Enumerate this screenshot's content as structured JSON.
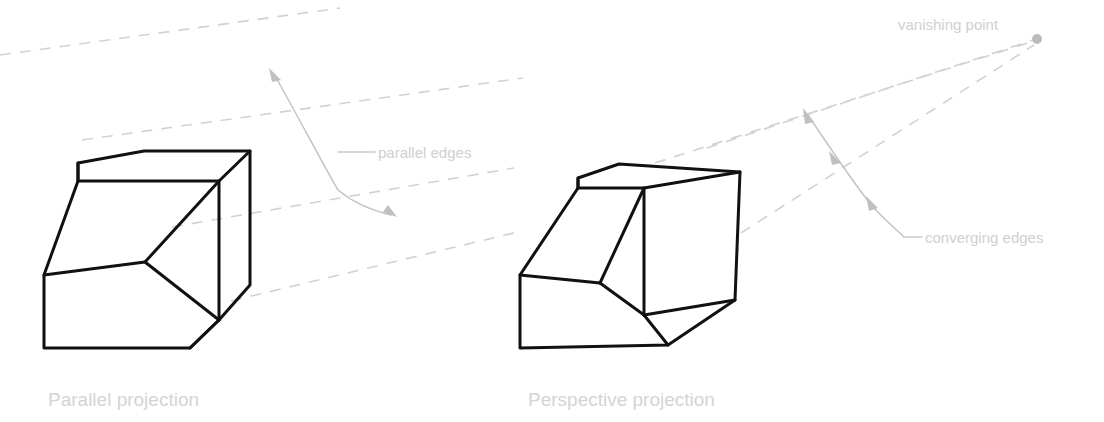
{
  "page": {
    "background_color": "#ffffff",
    "width": 1104,
    "height": 422
  },
  "colors": {
    "solid_edge": "#111111",
    "dashed_guide": "#d2d2d2",
    "annotation_line": "#c4c4c4",
    "annotation_text": "#d0d0d0",
    "caption_text": "#d4d4d4",
    "vanishing_point_dot": "#bcbcbc"
  },
  "panels": [
    {
      "id": "parallel",
      "caption": "Parallel projection",
      "annotations": [
        {
          "id": "parallel-edges",
          "text": "parallel edges"
        }
      ]
    },
    {
      "id": "perspective",
      "caption": "Perspective projection",
      "annotations": [
        {
          "id": "vanishing-point",
          "text": "vanishing point"
        },
        {
          "id": "converging-edges",
          "text": "converging edges"
        }
      ]
    }
  ],
  "labels": {
    "parallel_edges": "parallel edges",
    "vanishing_point": "vanishing point",
    "converging_edges": "converging edges",
    "caption_left": "Parallel projection",
    "caption_right": "Perspective projection"
  },
  "geometry": {
    "left_solid": {
      "description": "Box with a chamfered / beveled front-left-bottom corner drawn in parallel (axonometric) projection; all receding edges are mutually parallel.",
      "top_face": "M 78,163 L 144,151 L 250,151 L 219,181 L 78,181 Z",
      "right_face": "M 250,151 L 250,285 L 219,320 L 219,181 Z",
      "front_face": "M 44,275 L 145,262 L 219,320 L 190,348 L 44,348 Z",
      "bevel_face": "M 78,181 L 219,181 L 145,262 L 44,275 Z",
      "inner_vertical": "M 219,181 L 219,320",
      "y_junction": [
        145,
        262
      ]
    },
    "right_solid": {
      "description": "Same box drawn in one-point perspective; receding edges converge toward the vanishing point at the upper right.",
      "top_face": "M 578,178 L 619,164 L 740,172 L 644,188 L 578,188 Z",
      "right_face": "M 740,172 L 735,300 L 644,315 L 644,188 Z",
      "front_face": "M 520,275 L 600,283 L 644,315 L 668,345 L 520,348 Z",
      "bevel_face": "M 578,188 L 644,188 L 600,283 L 520,275 Z",
      "y_junction": [
        600,
        283
      ]
    },
    "dashed_guides_left": [
      "M 0,55 L 340,8",
      "M 85,139 L 520,78",
      "M 175,225 L 512,166",
      "M 232,300 L 520,230"
    ],
    "dashed_guides_right": [
      "M 706,148 L 1034,40",
      "M 656,162 L 1032,42",
      "M 742,232 L 1035,44"
    ],
    "vanishing_point": {
      "x": 1037,
      "y": 39,
      "r": 5
    },
    "double_arrow_left": "M 272,72 Q 320,160 337,190 Q 370,208 393,215",
    "double_arrow_right": "M 806,113 Q 840,160 868,200 Q 890,222 904,236",
    "leader_left": "M 337,152 L 374,152",
    "leader_right": "M 904,237 L 922,237"
  },
  "text_positions": {
    "parallel_edges": {
      "x": 378,
      "y": 158
    },
    "vanishing_point": {
      "x": 898,
      "y": 30
    },
    "converging_edges": {
      "x": 924,
      "y": 243
    },
    "caption_left": {
      "x": 48,
      "y": 406
    },
    "caption_right": {
      "x": 528,
      "y": 406
    }
  }
}
